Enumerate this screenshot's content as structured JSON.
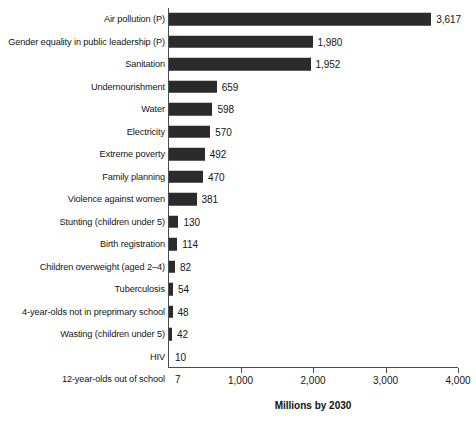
{
  "chart_data": {
    "type": "bar",
    "orientation": "horizontal",
    "title": "",
    "xlabel": "Millions by 2030",
    "ylabel": "",
    "xlim": [
      0,
      4000
    ],
    "xticks": [
      1000,
      2000,
      3000,
      4000
    ],
    "xtick_labels": [
      "1,000",
      "2,000",
      "3,000",
      "4,000"
    ],
    "grid": false,
    "legend": null,
    "bar_color": "#2b2b2b",
    "background_color": "#ffffff",
    "axis_color": "#4a4a4a",
    "categories": [
      "Air pollution (P)",
      "Gender equality in public leadership (P)",
      "Sanitation",
      "Undernourishment",
      "Water",
      "Electricity",
      "Extreme poverty",
      "Family planning",
      "Violence against women",
      "Stunting (children under 5)",
      "Birth registration",
      "Children overweight (aged 2–4)",
      "Tuberculosis",
      "4-year-olds not in preprimary school",
      "Wasting (children under 5)",
      "HIV",
      "12-year-olds out of school"
    ],
    "values": [
      3617,
      1980,
      1952,
      659,
      598,
      570,
      492,
      470,
      381,
      130,
      114,
      82,
      54,
      48,
      42,
      10,
      7
    ],
    "value_labels": [
      "3,617",
      "1,980",
      "1,952",
      "659",
      "598",
      "570",
      "492",
      "470",
      "381",
      "130",
      "114",
      "82",
      "54",
      "48",
      "42",
      "10",
      "7"
    ]
  },
  "rows": [
    {
      "label": "Air pollution (P)",
      "value": 3617,
      "value_label": "3,617"
    },
    {
      "label": "Gender equality in public leadership (P)",
      "value": 1980,
      "value_label": "1,980"
    },
    {
      "label": "Sanitation",
      "value": 1952,
      "value_label": "1,952"
    },
    {
      "label": "Undernourishment",
      "value": 659,
      "value_label": "659"
    },
    {
      "label": "Water",
      "value": 598,
      "value_label": "598"
    },
    {
      "label": "Electricity",
      "value": 570,
      "value_label": "570"
    },
    {
      "label": "Extreme poverty",
      "value": 492,
      "value_label": "492"
    },
    {
      "label": "Family planning",
      "value": 470,
      "value_label": "470"
    },
    {
      "label": "Violence against women",
      "value": 381,
      "value_label": "381"
    },
    {
      "label": "Stunting (children under 5)",
      "value": 130,
      "value_label": "130"
    },
    {
      "label": "Birth registration",
      "value": 114,
      "value_label": "114"
    },
    {
      "label": "Children overweight (aged 2–4)",
      "value": 82,
      "value_label": "82"
    },
    {
      "label": "Tuberculosis",
      "value": 54,
      "value_label": "54"
    },
    {
      "label": "4-year-olds not in preprimary school",
      "value": 48,
      "value_label": "48"
    },
    {
      "label": "Wasting (children under 5)",
      "value": 42,
      "value_label": "42"
    },
    {
      "label": "HIV",
      "value": 10,
      "value_label": "10"
    },
    {
      "label": "12-year-olds out of school",
      "value": 7,
      "value_label": "7"
    }
  ],
  "axis": {
    "x_title": "Millions by 2030",
    "ticks": [
      {
        "value": 1000,
        "label": "1,000"
      },
      {
        "value": 2000,
        "label": "2,000"
      },
      {
        "value": 3000,
        "label": "3,000"
      },
      {
        "value": 4000,
        "label": "4,000"
      }
    ]
  }
}
